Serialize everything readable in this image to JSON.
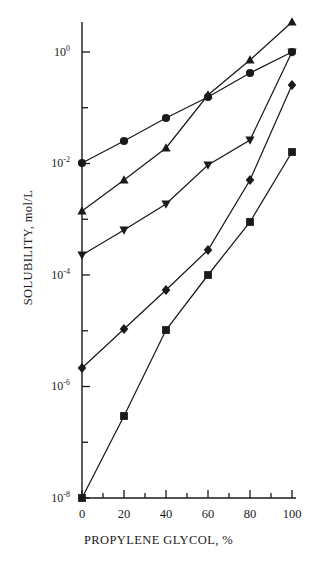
{
  "chart_data": {
    "type": "line",
    "title": "",
    "xlabel": "PROPYLENE GLYCOL, %",
    "ylabel": "SOLUBILITY, mol/L",
    "xlim": [
      0,
      100
    ],
    "ylim": [
      1e-08,
      3
    ],
    "yscale": "log",
    "grid": false,
    "legend": "none",
    "xticks": [
      0,
      20,
      40,
      60,
      80,
      100
    ],
    "xtick_labels": [
      "0",
      "20",
      "40",
      "60",
      "80",
      "100"
    ],
    "xminor_ticks": [
      10,
      30,
      50,
      70,
      90
    ],
    "yticks": [
      1,
      0.01,
      0.0001,
      1e-06,
      1e-08
    ],
    "ytick_labels": [
      "10",
      "10",
      "10",
      "10",
      "10"
    ],
    "ytick_exponents": [
      "0",
      "-2",
      "-4",
      "-6",
      "-8"
    ],
    "yminor_ticks": [
      0.1,
      0.001,
      1e-05,
      1e-07
    ],
    "series": [
      {
        "name": "series-up-triangle",
        "marker": "triangle-up",
        "x": [
          0,
          20,
          40,
          60,
          80,
          100
        ],
        "y": [
          0.0016,
          0.0055,
          0.032,
          0.125,
          0.9,
          2.6
        ]
      },
      {
        "name": "series-circle",
        "marker": "circle",
        "x": [
          0,
          20,
          40,
          60,
          80,
          100
        ],
        "y": [
          0.01,
          0.025,
          0.066,
          0.13,
          0.3,
          1.0
        ]
      },
      {
        "name": "series-down-triangle",
        "marker": "triangle-down",
        "x": [
          0,
          20,
          40,
          60,
          80,
          100
        ],
        "y": [
          0.0001,
          0.00035,
          0.0018,
          0.014,
          0.11,
          1.0
        ]
      },
      {
        "name": "series-diamond",
        "marker": "diamond",
        "x": [
          0,
          20,
          40,
          60,
          80,
          100
        ],
        "y": [
          3.5e-06,
          3e-05,
          0.00022,
          0.0026,
          0.025,
          0.28
        ]
      },
      {
        "name": "series-square",
        "marker": "square",
        "x": [
          0,
          20,
          40,
          60,
          80,
          100
        ],
        "y": [
          1.6e-08,
          3.5e-07,
          0.0001,
          0.0001,
          0.0009,
          0.016
        ]
      }
    ],
    "series_points_px": {
      "note": "marker pixel positions as rendered",
      "up_triangle": [
        [
          0,
          211
        ],
        [
          20,
          180
        ],
        [
          40,
          148
        ],
        [
          60,
          95
        ],
        [
          80,
          60
        ],
        [
          100,
          22
        ]
      ],
      "circle": [
        [
          0,
          163
        ],
        [
          20,
          141
        ],
        [
          40,
          118
        ],
        [
          60,
          97
        ],
        [
          80,
          73
        ],
        [
          100,
          52
        ]
      ],
      "down_triangle": [
        [
          0,
          255
        ],
        [
          20,
          230
        ],
        [
          40,
          204
        ],
        [
          60,
          165
        ],
        [
          80,
          140
        ],
        [
          100,
          52
        ]
      ],
      "diamond": [
        [
          0,
          368
        ],
        [
          20,
          329
        ],
        [
          40,
          290
        ],
        [
          60,
          250
        ],
        [
          80,
          180
        ],
        [
          100,
          85
        ]
      ],
      "square": [
        [
          0,
          498
        ],
        [
          20,
          416
        ],
        [
          40,
          330
        ],
        [
          60,
          275
        ],
        [
          80,
          222
        ],
        [
          100,
          152
        ]
      ]
    }
  }
}
